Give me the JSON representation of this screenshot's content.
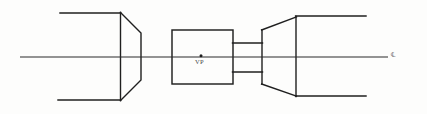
{
  "drawing": {
    "title": "Vessel Longitudinal Section",
    "background_color": "#fdfdfc",
    "line_color": "#1f1f1f",
    "labels": {
      "vanishing_point": "VP",
      "centerline": "℄"
    },
    "annotations": [
      {
        "name": "vanishing-point",
        "text": "VP",
        "x": 196,
        "y": 61
      },
      {
        "name": "centerline-mark",
        "text": "℄",
        "x": 391,
        "y": 52
      }
    ],
    "geometry": {
      "centerline": {
        "x1": 20,
        "y1": 57,
        "x2": 388,
        "y2": 57
      },
      "vp_dot": {
        "cx": 201,
        "cy": 56,
        "r": 1.3
      },
      "left_body": {
        "top_line": {
          "x1": 60,
          "y1": 13,
          "x2": 120,
          "y2": 13
        },
        "bottom_line": {
          "x1": 58,
          "y1": 100,
          "x2": 120,
          "y2": 100
        },
        "vertical": {
          "x1": 120,
          "y1": 13,
          "x2": 120,
          "y2": 100
        },
        "taper_top": {
          "x1": 120,
          "y1": 13,
          "x2": 141,
          "y2": 33
        },
        "taper_right": {
          "x1": 141,
          "y1": 33,
          "x2": 141,
          "y2": 80
        },
        "taper_bottom": {
          "x1": 141,
          "y1": 80,
          "x2": 120,
          "y2": 100
        }
      },
      "center_box": {
        "x": 172,
        "y": 30,
        "width": 61,
        "height": 54
      },
      "connector": {
        "top_line": {
          "x1": 233,
          "y1": 43,
          "x2": 262,
          "y2": 43
        },
        "bottom_line": {
          "x1": 233,
          "y1": 72,
          "x2": 262,
          "y2": 72
        },
        "left_edge": {
          "x1": 233,
          "y1": 43,
          "x2": 233,
          "y2": 72
        }
      },
      "right_body": {
        "narrow_edge": {
          "x1": 262,
          "y1": 30,
          "x2": 262,
          "y2": 84
        },
        "flare_top": {
          "x1": 262,
          "y1": 30,
          "x2": 296,
          "y2": 17
        },
        "flare_bottom": {
          "x1": 262,
          "y1": 84,
          "x2": 296,
          "y2": 96
        },
        "vertical": {
          "x1": 296,
          "y1": 17,
          "x2": 296,
          "y2": 96
        },
        "top_line": {
          "x1": 296,
          "y1": 16,
          "x2": 366,
          "y2": 16
        },
        "bottom_line": {
          "x1": 296,
          "y1": 96,
          "x2": 366,
          "y2": 96
        }
      }
    }
  }
}
